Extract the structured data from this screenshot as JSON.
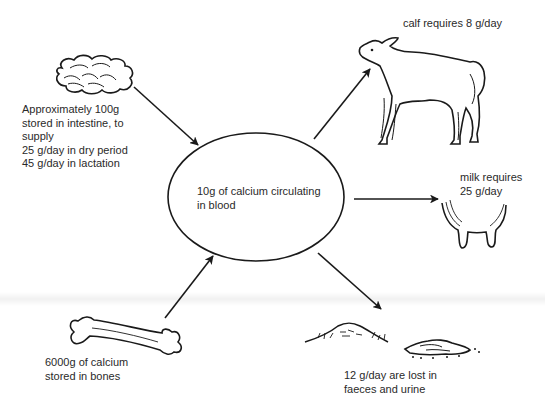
{
  "diagram": {
    "center": {
      "label": "10g of calcium circulating\nin blood",
      "shape": "ellipse"
    },
    "sources": [
      {
        "id": "intestine",
        "icon": "intestine-icon",
        "label": "Approximately  100g\nstored in intestine, to\nsupply\n25 g/day in dry period\n45 g/day in lactation"
      },
      {
        "id": "bones",
        "icon": "bone-icon",
        "label": "6000g of calcium\nstored in bones"
      }
    ],
    "sinks": [
      {
        "id": "calf",
        "icon": "calf-icon",
        "label": "calf requires 8 g/day"
      },
      {
        "id": "milk",
        "icon": "udder-icon",
        "label": "milk requires\n25 g/day"
      },
      {
        "id": "excretion",
        "icon": "faeces-urine-icon",
        "label": "12 g/day  are  lost  in\nfaeces and urine"
      }
    ],
    "edges": [
      {
        "from": "intestine",
        "to": "center"
      },
      {
        "from": "bones",
        "to": "center"
      },
      {
        "from": "center",
        "to": "calf"
      },
      {
        "from": "center",
        "to": "milk"
      },
      {
        "from": "center",
        "to": "excretion"
      }
    ],
    "colors": {
      "line": "#1a1a1a",
      "text": "#2a2a2a",
      "background": "#ffffff"
    }
  }
}
